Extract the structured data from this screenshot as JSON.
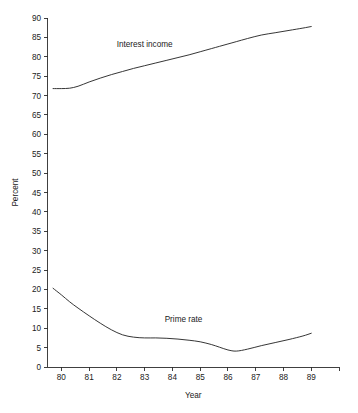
{
  "chart_data": {
    "type": "line",
    "title": "",
    "xlabel": "Year",
    "ylabel": "Percent",
    "xlim": [
      79.5,
      90.0
    ],
    "ylim": [
      0,
      90
    ],
    "grid": false,
    "legend_position": "inline-labels",
    "x_tick_labels": [
      "80",
      "81",
      "82",
      "83",
      "84",
      "85",
      "86",
      "87",
      "88",
      "89"
    ],
    "x_tick_values": [
      80,
      81,
      82,
      83,
      84,
      85,
      86,
      87,
      88,
      89
    ],
    "y_tick_labels": [
      "0",
      "5",
      "10",
      "15",
      "20",
      "25",
      "30",
      "35",
      "40",
      "45",
      "50",
      "55",
      "60",
      "65",
      "70",
      "75",
      "80",
      "85",
      "90"
    ],
    "y_tick_values": [
      0,
      5,
      10,
      15,
      20,
      25,
      30,
      35,
      40,
      45,
      50,
      55,
      60,
      65,
      70,
      75,
      80,
      85,
      90
    ],
    "x": [
      79.7,
      80.0,
      80.3,
      80.6,
      81.0,
      81.4,
      81.8,
      82.2,
      82.6,
      83.0,
      83.4,
      83.8,
      84.2,
      84.6,
      85.0,
      85.4,
      85.7,
      86.0,
      86.3,
      86.7,
      87.2,
      87.7,
      88.2,
      88.7,
      89.0
    ],
    "series": [
      {
        "name": "Interest income",
        "label": "Interest income",
        "color": "#2b2b2b",
        "values": [
          71.8,
          71.8,
          71.9,
          72.4,
          73.5,
          74.5,
          75.4,
          76.2,
          77.0,
          77.7,
          78.4,
          79.1,
          79.8,
          80.5,
          81.3,
          82.1,
          82.7,
          83.3,
          83.9,
          84.7,
          85.6,
          86.2,
          86.8,
          87.4,
          87.8
        ],
        "label_position": {
          "x": 83.0,
          "y": 82.5
        }
      },
      {
        "name": "Prime rate",
        "label": "Prime rate",
        "color": "#2b2b2b",
        "values": [
          20.3,
          18.6,
          16.8,
          15.2,
          13.2,
          11.3,
          9.6,
          8.3,
          7.7,
          7.5,
          7.5,
          7.4,
          7.2,
          6.9,
          6.5,
          5.8,
          5.1,
          4.4,
          4.1,
          4.6,
          5.5,
          6.3,
          7.1,
          8.0,
          8.7
        ],
        "label_position": {
          "x": 84.4,
          "y": 11.5
        }
      }
    ]
  },
  "axes": {
    "y_axis_title": "Percent",
    "x_axis_title": "Year"
  }
}
